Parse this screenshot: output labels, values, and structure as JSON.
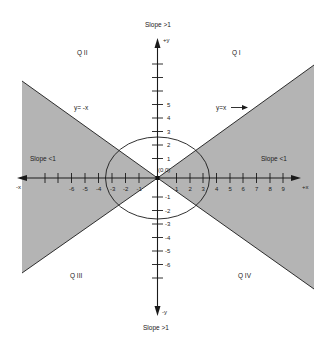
{
  "diagram": {
    "colors": {
      "shade": "#b4b4b4",
      "line": "#1a1a1a",
      "background": "#ffffff"
    },
    "quadrants": {
      "q1": "Q I",
      "q2": "Q II",
      "q3": "Q III",
      "q4": "Q IV"
    },
    "axes": {
      "plus_x": "+x",
      "minus_x": "-x",
      "plus_y": "+y",
      "minus_y": "-y",
      "origin": "(0,0)"
    },
    "slope_labels": {
      "top": "Slope >1",
      "bottom": "Slope >1",
      "left": "Slope <1",
      "right": "Slope <1"
    },
    "line_labels": {
      "y_eq_x": "y=x",
      "y_eq_neg_x": "y= -x"
    },
    "x_tick_labels": {
      "negative": [
        "-6",
        "-5",
        "-4",
        "-3",
        "-2",
        "-1"
      ],
      "positive": [
        "1",
        "2",
        "3",
        "4",
        "5",
        "6",
        "7",
        "8",
        "9"
      ]
    },
    "y_tick_labels": {
      "positive": [
        "1",
        "2",
        "3",
        "4",
        "5"
      ],
      "negative": [
        "-1",
        "-2",
        "-3",
        "-4",
        "-5",
        "-6"
      ]
    }
  }
}
